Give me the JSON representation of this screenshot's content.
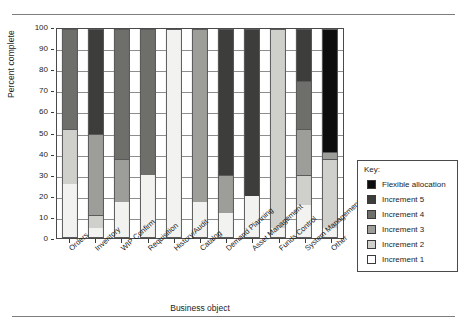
{
  "chart_data": {
    "type": "bar",
    "subtype": "stacked-bar-100-percent",
    "title": "",
    "xlabel": "Business object",
    "ylabel": "Percent complete",
    "ylim": [
      0,
      100
    ],
    "yticks": [
      0,
      10,
      20,
      30,
      40,
      50,
      60,
      70,
      80,
      90,
      100
    ],
    "grid": true,
    "legend_position": "right",
    "legend_title": "Key:",
    "categories": [
      "Orders",
      "Inventory",
      "WIP Confirm",
      "Requisition",
      "History/Audit",
      "Catalog",
      "Demand Planning",
      "Asset Management",
      "Funds Control",
      "System Management",
      "Other"
    ],
    "series": [
      {
        "name": "Increment 1",
        "color": "#f2f2f0",
        "values": [
          26,
          5,
          17,
          30,
          100,
          17,
          12,
          20,
          5,
          16,
          5
        ]
      },
      {
        "name": "Increment 2",
        "color": "#cfcfcb",
        "values": [
          26,
          6,
          0,
          0,
          0,
          0,
          0,
          0,
          95,
          14,
          33
        ]
      },
      {
        "name": "Increment 3",
        "color": "#9d9d99",
        "values": [
          0,
          39,
          21,
          0,
          0,
          83,
          18,
          0,
          0,
          22,
          3
        ]
      },
      {
        "name": "Increment 4",
        "color": "#6e6e6b",
        "values": [
          48,
          0,
          62,
          70,
          0,
          0,
          0,
          0,
          0,
          23,
          0
        ]
      },
      {
        "name": "Increment 5",
        "color": "#3d3d3c",
        "values": [
          0,
          50,
          0,
          0,
          0,
          0,
          70,
          80,
          0,
          25,
          0
        ]
      },
      {
        "name": "Flexible allocation",
        "color": "#0d0d0d",
        "values": [
          0,
          0,
          0,
          0,
          0,
          0,
          0,
          0,
          0,
          0,
          59
        ]
      }
    ],
    "legend_entries": [
      {
        "label": "Flexible allocation",
        "color": "#0d0d0d"
      },
      {
        "label": "Increment 5",
        "color": "#3d3d3c"
      },
      {
        "label": "Increment 4",
        "color": "#6e6e6b"
      },
      {
        "label": "Increment 3",
        "color": "#9d9d99"
      },
      {
        "label": "Increment 2",
        "color": "#cfcfcb"
      },
      {
        "label": "Increment 1",
        "color": "#ffffff"
      }
    ]
  }
}
